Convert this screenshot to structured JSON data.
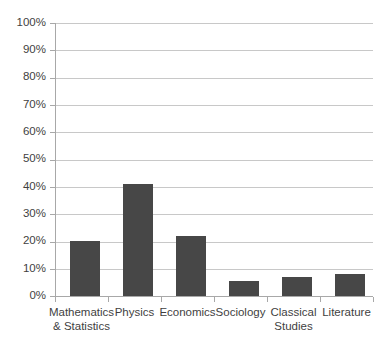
{
  "chart_data": {
    "type": "bar",
    "title": "",
    "xlabel": "",
    "ylabel": "",
    "categories": [
      "Mathematics & Statistics",
      "Physics",
      "Economics",
      "Sociology",
      "Classical Studies",
      "Literature"
    ],
    "values": [
      20,
      41,
      22,
      5.5,
      7,
      8
    ],
    "value_labels": [
      "20%",
      "41%",
      "22%",
      "5.5%",
      "7%",
      "8%"
    ],
    "ylim": [
      0,
      100
    ],
    "ytick_labels": [
      "100%",
      "90%",
      "80%",
      "70%",
      "60%",
      "50%",
      "40%",
      "30%",
      "20%",
      "10%",
      "0%"
    ],
    "ytick_values": [
      100,
      90,
      80,
      70,
      60,
      50,
      40,
      30,
      20,
      10,
      0
    ],
    "grid": true,
    "legend": false,
    "legend_position": "none",
    "series": [
      {
        "name": "Share",
        "values": [
          20,
          41,
          22,
          5.5,
          7,
          8
        ]
      }
    ]
  },
  "style": {
    "bar_color": "#474747",
    "gridline_color": "#c8c8c8",
    "axis_color": "#a8a8a8",
    "text_color": "#3f3f3f",
    "background": "#ffffff"
  }
}
